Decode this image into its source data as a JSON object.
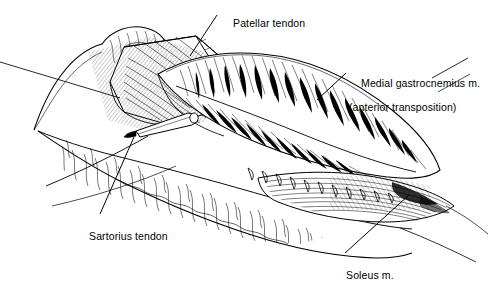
{
  "figure": {
    "type": "anatomical-line-illustration",
    "background_color": "#ffffff",
    "ink_color": "#000000",
    "width": 495,
    "height": 276
  },
  "labels": [
    {
      "id": "patellar-tendon",
      "text": "Patellar tendon",
      "line2": "",
      "x": 221,
      "y": 6,
      "leader": {
        "x1": 217,
        "y1": 15,
        "x2": 190,
        "y2": 56
      }
    },
    {
      "id": "medial-gastrocnemius",
      "text": "Medial gastrocnemius m.",
      "line2": "(anterior transposition)",
      "x": 349,
      "y": 66,
      "leader": {
        "x1": 346,
        "y1": 73,
        "x2": 317,
        "y2": 100
      }
    },
    {
      "id": "sartorius-tendon",
      "text": "Sartorius tendon",
      "line2": "",
      "x": 77,
      "y": 219,
      "leader": {
        "x1": 100,
        "y1": 214,
        "x2": 134,
        "y2": 137
      }
    },
    {
      "id": "soleus",
      "text": "Soleus m.",
      "line2": "",
      "x": 334,
      "y": 258,
      "leader": {
        "x1": 345,
        "y1": 253,
        "x2": 409,
        "y2": 195
      }
    }
  ],
  "structures": [
    {
      "id": "patellar-tendon-flap",
      "name": "Patellar tendon"
    },
    {
      "id": "medial-gastrocnemius-muscle",
      "name": "Medial gastrocnemius m."
    },
    {
      "id": "sartorius-tendon-structure",
      "name": "Sartorius tendon"
    },
    {
      "id": "soleus-muscle",
      "name": "Soleus m."
    },
    {
      "id": "subcutaneous-tissue",
      "name": "Subcutaneous tissue"
    },
    {
      "id": "surgical-elevator",
      "name": "Surgical elevator"
    },
    {
      "id": "suture-row",
      "name": "Suture row"
    },
    {
      "id": "retraction-sutures",
      "name": "Retraction sutures"
    }
  ]
}
